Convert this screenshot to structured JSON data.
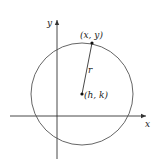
{
  "diagram": {
    "axes": {
      "x_label": "x",
      "y_label": "y"
    },
    "circle": {
      "center_label": "(h, k)",
      "point_label": "(x, y)",
      "radius_label": "r"
    },
    "colors": {
      "axis": "#333333",
      "circle": "#555555",
      "point": "#111111",
      "text": "#222222"
    }
  }
}
